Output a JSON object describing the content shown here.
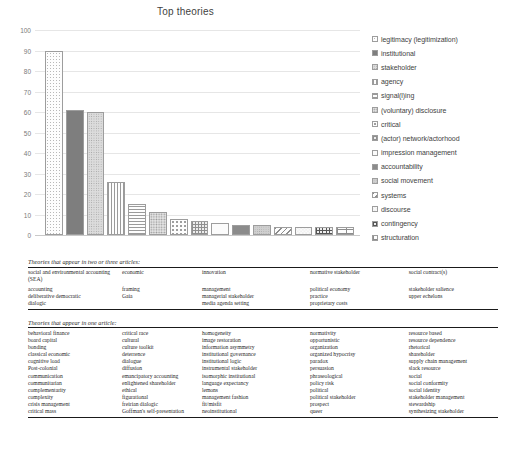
{
  "chart_data": {
    "type": "bar",
    "title": "Top theories",
    "xlabel": "",
    "ylabel": "",
    "ylim": [
      0,
      100
    ],
    "yticks": [
      100,
      90,
      80,
      70,
      60,
      50,
      40,
      30,
      20,
      10,
      0
    ],
    "grid": true,
    "legend_position": "right",
    "categories": [
      "legitimacy (legitimization)",
      "institutional",
      "stakeholder",
      "agency",
      "signal(l)ing",
      "(voluntary) disclosure",
      "critical",
      "(actor) network/actorhood",
      "impression management",
      "accountability",
      "social movement",
      "systems",
      "discourse",
      "contingency",
      "structuration"
    ],
    "values": [
      90,
      61,
      60,
      26,
      15,
      11,
      8,
      7,
      6,
      5,
      5,
      4,
      4,
      4,
      4
    ],
    "patterns": [
      "p-dots-sparse",
      "p-solid-dark",
      "p-dots-dense",
      "p-vlines",
      "p-hlines",
      "p-dots-med",
      "p-dots-big",
      "p-grid",
      "p-blank",
      "p-solid-mid",
      "p-dots-light",
      "p-diag",
      "p-circles",
      "p-bricks",
      "p-bigrid"
    ]
  },
  "chart": {
    "title": "Top theories",
    "y_axis_labels": [
      "100",
      "90",
      "80",
      "70",
      "60",
      "50",
      "40",
      "30",
      "20",
      "10",
      "0"
    ]
  },
  "legend": {
    "items": [
      {
        "label": "legitimacy (legitimization)",
        "pattern": "p-dots-sparse"
      },
      {
        "label": "institutional",
        "pattern": "p-solid-dark"
      },
      {
        "label": "stakeholder",
        "pattern": "p-dots-dense"
      },
      {
        "label": "agency",
        "pattern": "p-vlines"
      },
      {
        "label": "signal(l)ing",
        "pattern": "p-hlines"
      },
      {
        "label": "(voluntary) disclosure",
        "pattern": "p-dots-med"
      },
      {
        "label": "critical",
        "pattern": "p-dots-big"
      },
      {
        "label": "(actor) network/actorhood",
        "pattern": "p-grid"
      },
      {
        "label": "impression management",
        "pattern": "p-blank"
      },
      {
        "label": "accountability",
        "pattern": "p-solid-mid"
      },
      {
        "label": "social movement",
        "pattern": "p-dots-light"
      },
      {
        "label": "systems",
        "pattern": "p-diag"
      },
      {
        "label": "discourse",
        "pattern": "p-circles"
      },
      {
        "label": "contingency",
        "pattern": "p-bricks"
      },
      {
        "label": "structuration",
        "pattern": "p-bigrid"
      }
    ]
  },
  "table_two_three": {
    "caption": "Theories that appear in two or three articles:",
    "rows": [
      [
        "social and environmental accounting (SEA)",
        "economic",
        "innovation",
        "normative stakeholder",
        "social contract(s)"
      ],
      [
        "accounting",
        "framing",
        "management",
        "political economy",
        "stakeholder salience"
      ],
      [
        "deliberative democratic",
        "Gaia",
        "managerial stakeholder",
        "practice",
        "upper echelons"
      ],
      [
        "dialogic",
        "",
        "media agenda setting",
        "proprietary costs",
        ""
      ]
    ]
  },
  "table_one": {
    "caption": "Theories that appear in one article:",
    "rows": [
      [
        "behavioral finance",
        "critical race",
        "homogeneity",
        "normativity",
        "resource based"
      ],
      [
        "board capital",
        "cultural",
        "image restoration",
        "opportunistic",
        "resource dependence"
      ],
      [
        "bonding",
        "culture toolkit",
        "information asymmetry",
        "organization",
        "rhetorical"
      ],
      [
        "classical economic",
        "deterrence",
        "institutional governance",
        "organized hypocrisy",
        "shareholder"
      ],
      [
        "cognitive load",
        "dialogue",
        "institutional logic",
        "paradox",
        "supply chain management"
      ],
      [
        "Post-colonial",
        "diffusion",
        "instrumental stakeholder",
        "persuasion",
        "slack resource"
      ],
      [
        "communication",
        "emancipatory accounting",
        "isomorphic institutional",
        "phraseological",
        "social"
      ],
      [
        "communitarian",
        "enlightened shareholder",
        "language expectancy",
        "policy risk",
        "social conformity"
      ],
      [
        "complementarity",
        "ethical",
        "lemons",
        "political",
        "social identity"
      ],
      [
        "complexity",
        "figurational",
        "management fashion",
        "political stakeholder",
        "stakeholder management"
      ],
      [
        "crisis management",
        "freirian dialogic",
        "fit/misfit",
        "prospect",
        "stewardship"
      ],
      [
        "critical mass",
        "Goffman's self-presentation",
        "neoinstitutional",
        "queer",
        "synthesizing stakeholder"
      ]
    ]
  }
}
